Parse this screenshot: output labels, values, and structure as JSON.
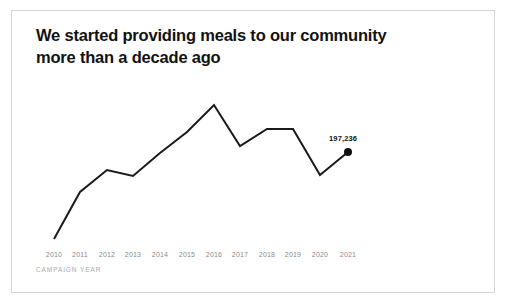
{
  "card": {
    "title": "We started providing meals to our community more than a decade ago",
    "border_color": "#d5d5d7",
    "background": "#ffffff"
  },
  "chart_data": {
    "type": "line",
    "title": "We started providing meals to our community more than a decade ago",
    "xlabel": "CAMPAIGN YEAR",
    "ylabel": "",
    "grid": false,
    "legend": false,
    "line_color": "#1a1a1a",
    "tick_color": "#8a8a8e",
    "axis_label_color": "#a8a8ac",
    "categories": [
      "2010",
      "2011",
      "2012",
      "2013",
      "2014",
      "2015",
      "2016",
      "2017",
      "2018",
      "2019",
      "2020",
      "2021"
    ],
    "values": [
      64000,
      119000,
      143000,
      135000,
      160000,
      186000,
      225000,
      174000,
      190000,
      190000,
      145000,
      197236
    ],
    "ylim": [
      40000,
      240000
    ],
    "pixel_points": [
      {
        "x": 42,
        "y": 228
      },
      {
        "x": 68,
        "y": 181
      },
      {
        "x": 95,
        "y": 159
      },
      {
        "x": 121,
        "y": 165
      },
      {
        "x": 148,
        "y": 142
      },
      {
        "x": 175,
        "y": 121
      },
      {
        "x": 202,
        "y": 94
      },
      {
        "x": 228,
        "y": 135
      },
      {
        "x": 255,
        "y": 118
      },
      {
        "x": 281,
        "y": 118
      },
      {
        "x": 308,
        "y": 164
      },
      {
        "x": 336,
        "y": 141
      }
    ],
    "end_point": {
      "category": "2021",
      "label": "197,236",
      "marker": "filled-circle",
      "marker_radius": 4
    },
    "annotations": [
      {
        "text": "197,236",
        "category": "2021",
        "position": "above-left"
      }
    ]
  }
}
